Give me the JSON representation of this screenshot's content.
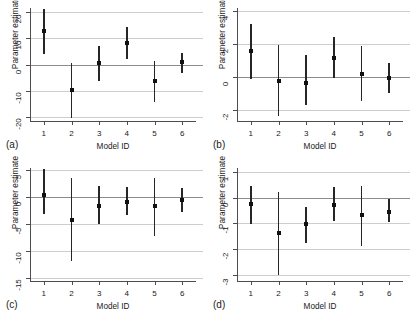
{
  "figure": {
    "panels": [
      {
        "letter": "(a)",
        "xlabel": "Model ID",
        "ylabel": "Parameter estimate",
        "ylim": [
          -21.5,
          21.5
        ],
        "yticks": [
          -20,
          -10,
          0,
          10,
          20
        ],
        "xticklabels": [
          "1",
          "2",
          "3",
          "4",
          "5",
          "6"
        ]
      },
      {
        "letter": "(b)",
        "xlabel": "Model ID",
        "ylabel": "Parameter estimate",
        "ylim": [
          -2.7,
          4.2
        ],
        "yticks": [
          -2,
          0,
          2,
          4
        ],
        "xticklabels": [
          "1",
          "2",
          "3",
          "4",
          "5",
          "6"
        ]
      },
      {
        "letter": "(c)",
        "xlabel": "Model ID",
        "ylabel": "Parameter estimate",
        "ylim": [
          -15.6,
          5.4
        ],
        "yticks": [
          -15,
          -10,
          -5,
          0,
          5
        ],
        "xticklabels": [
          "1",
          "2",
          "3",
          "4",
          "5",
          "6"
        ]
      },
      {
        "letter": "(d)",
        "xlabel": "Model ID",
        "ylabel": "Parameter estimate",
        "ylim": [
          -3.25,
          1.15
        ],
        "yticks": [
          -3,
          -2,
          -1,
          0,
          1
        ],
        "xticklabels": [
          "1",
          "2",
          "3",
          "4",
          "5",
          "6"
        ]
      }
    ]
  },
  "chart_data": [
    {
      "type": "scatter",
      "panel": "(a)",
      "title": "",
      "xlabel": "Model ID",
      "ylabel": "Parameter estimate",
      "ylim": [
        -21.5,
        21.5
      ],
      "yticks": [
        -20,
        -10,
        0,
        10,
        20
      ],
      "grid": true,
      "legend": "none",
      "x": [
        1,
        2,
        3,
        4,
        5,
        6
      ],
      "categories": [
        "1",
        "2",
        "3",
        "4",
        "5",
        "6"
      ],
      "values": [
        12.6,
        -9.7,
        0.5,
        8.2,
        -6.2,
        0.9
      ],
      "error_low": [
        4.1,
        -20.2,
        -6.2,
        2.1,
        -14.2,
        -3.2
      ],
      "error_high": [
        21.0,
        0.7,
        7.0,
        14.2,
        1.3,
        4.4
      ]
    },
    {
      "type": "scatter",
      "panel": "(b)",
      "title": "",
      "xlabel": "Model ID",
      "ylabel": "Parameter estimate",
      "ylim": [
        -2.7,
        4.2
      ],
      "yticks": [
        -2,
        0,
        2,
        4
      ],
      "grid": true,
      "legend": "none",
      "x": [
        1,
        2,
        3,
        4,
        5,
        6
      ],
      "categories": [
        "1",
        "2",
        "3",
        "4",
        "5",
        "6"
      ],
      "values": [
        1.6,
        -0.26,
        -0.37,
        1.15,
        0.18,
        -0.08
      ],
      "error_low": [
        -0.12,
        -2.4,
        -1.75,
        -0.07,
        -1.45,
        -0.97
      ],
      "error_high": [
        3.25,
        1.95,
        1.3,
        2.45,
        1.9,
        0.85
      ]
    },
    {
      "type": "scatter",
      "panel": "(c)",
      "title": "",
      "xlabel": "Model ID",
      "ylabel": "Parameter estimate",
      "ylim": [
        -15.6,
        5.4
      ],
      "yticks": [
        -15,
        -10,
        -5,
        0,
        5
      ],
      "grid": true,
      "legend": "none",
      "x": [
        1,
        2,
        3,
        4,
        5,
        6
      ],
      "categories": [
        "1",
        "2",
        "3",
        "4",
        "5",
        "6"
      ],
      "values": [
        0.45,
        -4.2,
        -1.7,
        -1.0,
        -1.7,
        -0.6
      ],
      "error_low": [
        -3.2,
        -11.9,
        -5.0,
        -3.4,
        -7.3,
        -2.8
      ],
      "error_high": [
        5.2,
        3.5,
        2.0,
        1.8,
        3.6,
        1.7
      ]
    },
    {
      "type": "scatter",
      "panel": "(d)",
      "title": "",
      "xlabel": "Model ID",
      "ylabel": "Parameter estimate",
      "ylim": [
        -3.25,
        1.15
      ],
      "yticks": [
        -3,
        -2,
        -1,
        0,
        1
      ],
      "grid": true,
      "legend": "none",
      "x": [
        1,
        2,
        3,
        4,
        5,
        6
      ],
      "categories": [
        "1",
        "2",
        "3",
        "4",
        "5",
        "6"
      ],
      "values": [
        -0.24,
        -1.4,
        -1.02,
        -0.3,
        -0.68,
        -0.58
      ],
      "error_low": [
        -1.02,
        -3.02,
        -1.77,
        -0.9,
        -1.88,
        -0.97
      ],
      "error_high": [
        0.45,
        0.22,
        -0.35,
        0.4,
        0.45,
        -0.07
      ]
    }
  ]
}
